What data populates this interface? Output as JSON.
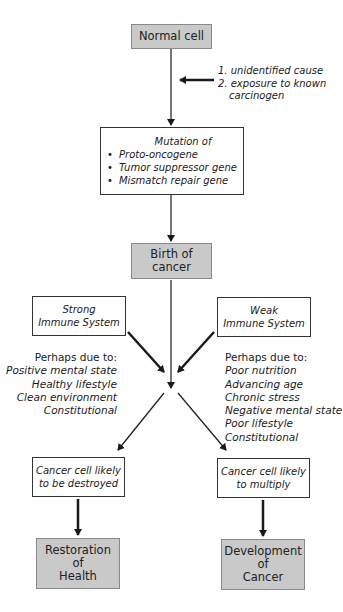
{
  "diagram": {
    "normal_cell": "Normal cell",
    "causes": [
      "1. unidentified cause",
      "2. exposure to known",
      "carcinogen"
    ],
    "mutation": {
      "title": "Mutation of",
      "items": [
        "Proto-oncogene",
        "Tumor suppressor gene",
        "Mismatch repair gene"
      ]
    },
    "birth": [
      "Birth of",
      "cancer"
    ],
    "strong": [
      "Strong",
      "Immune System"
    ],
    "weak": [
      "Weak",
      "Immune System"
    ],
    "strong_factors": {
      "heading": "Perhaps due to:",
      "items": [
        "Positive mental state",
        "Healthy lifestyle",
        "Clean environment",
        "Constitutional"
      ]
    },
    "weak_factors": {
      "heading": "Perhaps due to:",
      "items": [
        "Poor nutrition",
        "Advancing age",
        "Chronic stress",
        "Negative mental state",
        "Poor lifestyle",
        "Constitutional"
      ]
    },
    "destroyed": [
      "Cancer cell likely",
      "to be destroyed"
    ],
    "multiply": [
      "Cancer cell likely",
      "to multiply"
    ],
    "restoration": [
      "Restoration",
      "of",
      "Health"
    ],
    "development": [
      "Development",
      "of",
      "Cancer"
    ]
  },
  "colors": {
    "gray_box": "#c9c9c9",
    "line": "#1a1a1a"
  }
}
